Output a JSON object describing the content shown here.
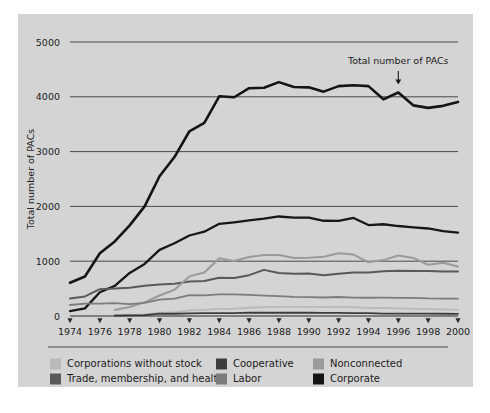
{
  "figure": {
    "panel_color": "#d4d4d4",
    "background_color": "#ffffff"
  },
  "chart_data": {
    "type": "line",
    "title": "",
    "xlabel": "",
    "ylabel": "Total number of PACs",
    "xlim": [
      1974,
      2000
    ],
    "ylim": [
      0,
      5000
    ],
    "grid": "horizontal",
    "legend_position": "bottom",
    "x": [
      1974,
      1975,
      1976,
      1977,
      1978,
      1979,
      1980,
      1981,
      1982,
      1983,
      1984,
      1985,
      1986,
      1987,
      1988,
      1989,
      1990,
      1991,
      1992,
      1993,
      1994,
      1995,
      1996,
      1997,
      1998,
      1999,
      2000
    ],
    "xticks": [
      1974,
      1976,
      1978,
      1980,
      1982,
      1984,
      1986,
      1988,
      1990,
      1992,
      1994,
      1996,
      1998,
      2000
    ],
    "xticklabels": [
      "1974",
      "1976",
      "1978",
      "1980",
      "1982",
      "1984",
      "1986",
      "1988",
      "1990",
      "1992",
      "1994",
      "1996",
      "1998",
      "2000"
    ],
    "yticks": [
      0,
      1000,
      2000,
      3000,
      4000,
      5000
    ],
    "yticklabels": [
      "0",
      "1000",
      "2000",
      "3000",
      "4000",
      "5000"
    ],
    "annotations": [
      {
        "text": "Total number of PACs",
        "x": 1996,
        "y": 4150,
        "label_y": 4600,
        "arrow": "down"
      }
    ],
    "series": [
      {
        "name": "Total number of PACs",
        "legend_key": "Corporate",
        "color": "#141414",
        "width": 2.6,
        "values": [
          608,
          722,
          1146,
          1360,
          1653,
          2000,
          2551,
          2901,
          3371,
          3525,
          4009,
          3992,
          4157,
          4165,
          4268,
          4178,
          4172,
          4094,
          4195,
          4210,
          4195,
          3954,
          4079,
          3844,
          3798,
          3835,
          3907
        ]
      },
      {
        "name": "Corporate",
        "legend_key": "Corporate",
        "color": "#171717",
        "width": 2.3,
        "values": [
          89,
          139,
          433,
          550,
          785,
          950,
          1206,
          1327,
          1469,
          1538,
          1682,
          1710,
          1744,
          1775,
          1816,
          1796,
          1795,
          1738,
          1735,
          1789,
          1660,
          1674,
          1642,
          1617,
          1597,
          1548,
          1523
        ]
      },
      {
        "name": "Trade, membership, and health",
        "legend_key": "Trade, membership, and health",
        "color": "#595959",
        "width": 2.0,
        "values": [
          318,
          357,
          489,
          500,
          516,
          550,
          576,
          589,
          628,
          638,
          698,
          692,
          745,
          842,
          786,
          770,
          774,
          742,
          770,
          795,
          792,
          815,
          825,
          821,
          821,
          812,
          812
        ]
      },
      {
        "name": "Nonconnected",
        "legend_key": "Nonconnected",
        "color": "#9a9a9a",
        "width": 2.0,
        "values": [
          0,
          0,
          0,
          110,
          165,
          250,
          374,
          480,
          723,
          793,
          1053,
          1003,
          1077,
          1115,
          1115,
          1060,
          1062,
          1083,
          1145,
          1121,
          980,
          1020,
          1103,
          1060,
          935,
          972,
          902
        ]
      },
      {
        "name": "Labor",
        "legend_key": "Labor",
        "color": "#7c7c7c",
        "width": 1.8,
        "values": [
          201,
          226,
          224,
          234,
          217,
          240,
          297,
          318,
          380,
          378,
          394,
          394,
          384,
          373,
          364,
          349,
          346,
          338,
          347,
          337,
          333,
          334,
          332,
          332,
          321,
          318,
          316
        ]
      },
      {
        "name": "Corporations without stock",
        "legend_key": "Corporations without stock",
        "color": "#b9b9b9",
        "width": 1.8,
        "values": [
          0,
          0,
          0,
          20,
          24,
          30,
          56,
          68,
          103,
          110,
          130,
          132,
          151,
          163,
          168,
          167,
          167,
          162,
          165,
          162,
          144,
          146,
          138,
          131,
          124,
          120,
          115
        ]
      },
      {
        "name": "Cooperative",
        "legend_key": "Cooperative",
        "color": "#3c3c3c",
        "width": 1.8,
        "values": [
          0,
          0,
          0,
          8,
          12,
          17,
          42,
          41,
          47,
          51,
          52,
          54,
          60,
          59,
          59,
          59,
          59,
          57,
          56,
          53,
          53,
          44,
          44,
          42,
          45,
          41,
          39
        ]
      }
    ]
  },
  "legend": {
    "items": [
      {
        "label": "Corporations without stock",
        "color": "#b9b9b9"
      },
      {
        "label": "Trade, membership, and health",
        "color": "#595959"
      },
      {
        "label": "Cooperative",
        "color": "#3c3c3c"
      },
      {
        "label": "Labor",
        "color": "#7c7c7c"
      },
      {
        "label": "Nonconnected",
        "color": "#9a9a9a"
      },
      {
        "label": "Corporate",
        "color": "#141414"
      }
    ]
  }
}
